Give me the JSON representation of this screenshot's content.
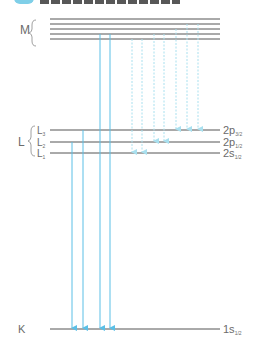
{
  "title": {
    "text": "",
    "icon": "title-badge-icon",
    "note": "cropped"
  },
  "colors": {
    "level_line": "#555555",
    "arrow_solid": "#5bbfe6",
    "arrow_dotted": "#a9e0ef",
    "label": "#6b6b6b"
  },
  "shells": {
    "M": {
      "label": "M",
      "lines": 5
    },
    "L": {
      "label": "L",
      "sublevels": [
        {
          "name": "L",
          "sub": "3",
          "orbital": "2p",
          "j": "3/2"
        },
        {
          "name": "L",
          "sub": "2",
          "orbital": "2p",
          "j": "1/2"
        },
        {
          "name": "L",
          "sub": "1",
          "orbital": "2s",
          "j": "1/2"
        }
      ]
    },
    "K": {
      "label": "K",
      "orbital": "1s",
      "j": "1/2"
    }
  },
  "transitions": {
    "solid_to_K": [
      {
        "from": "L3",
        "to": "K"
      },
      {
        "from": "L2",
        "to": "K"
      },
      {
        "from": "M",
        "to": "K"
      },
      {
        "from": "M",
        "to": "K"
      }
    ],
    "dotted_M_to_L": [
      {
        "from": "M",
        "to": "L1"
      },
      {
        "from": "M",
        "to": "L1"
      },
      {
        "from": "M",
        "to": "L2"
      },
      {
        "from": "M",
        "to": "L2"
      },
      {
        "from": "M",
        "to": "L3"
      },
      {
        "from": "M",
        "to": "L3"
      },
      {
        "from": "M",
        "to": "L3"
      }
    ]
  }
}
